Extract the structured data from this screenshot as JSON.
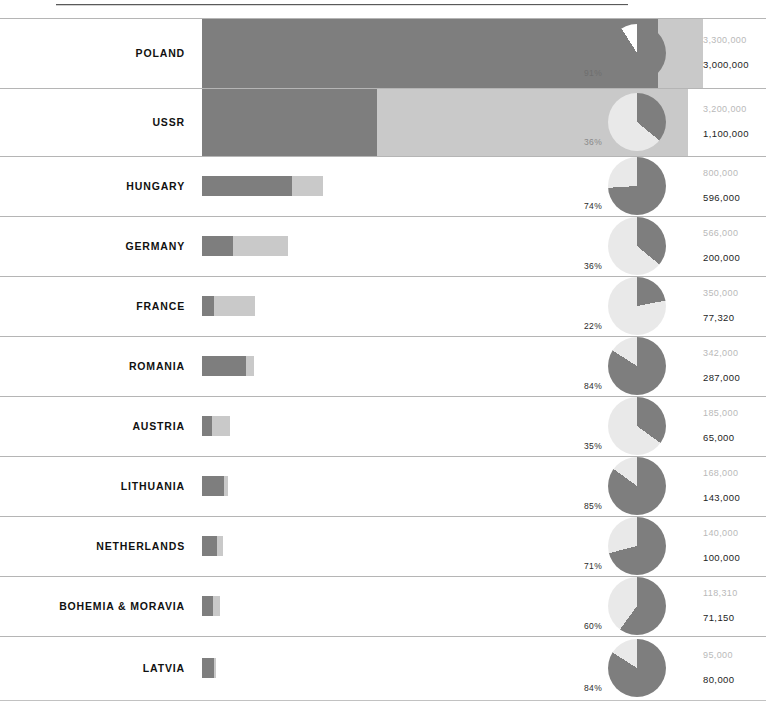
{
  "chart_data": {
    "type": "bar",
    "title": "",
    "subtitle": "",
    "xlabel": "",
    "ylabel": "",
    "legend": [],
    "grid": false,
    "orientation": "horizontal",
    "categories": [
      "POLAND",
      "USSR",
      "HUNGARY",
      "GERMANY",
      "FRANCE",
      "ROMANIA",
      "AUSTRIA",
      "LITHUANIA",
      "NETHERLANDS",
      "BOHEMIA & MORAVIA",
      "LATVIA"
    ],
    "series": [
      {
        "name": "total",
        "values": [
          3300000,
          3200000,
          800000,
          566000,
          350000,
          342000,
          185000,
          168000,
          140000,
          118310,
          95000
        ]
      },
      {
        "name": "killed",
        "values": [
          3000000,
          1100000,
          596000,
          200000,
          77320,
          287000,
          65000,
          143000,
          100000,
          71150,
          80000
        ]
      }
    ],
    "percent_values": [
      91,
      36,
      74,
      36,
      22,
      84,
      35,
      85,
      71,
      60,
      84
    ],
    "axis_max": 3300000
  },
  "rows": [
    {
      "label": "POLAND",
      "total_label": "3,300,000",
      "killed_label": "3,000,000",
      "pct_label": "91%",
      "pct_value": 91
    },
    {
      "label": "USSR",
      "total_label": "3,200,000",
      "killed_label": "1,100,000",
      "pct_label": "36%",
      "pct_value": 36
    },
    {
      "label": "HUNGARY",
      "total_label": "800,000",
      "killed_label": "596,000",
      "pct_label": "74%",
      "pct_value": 74
    },
    {
      "label": "GERMANY",
      "total_label": "566,000",
      "killed_label": "200,000",
      "pct_label": "36%",
      "pct_value": 36
    },
    {
      "label": "FRANCE",
      "total_label": "350,000",
      "killed_label": "77,320",
      "pct_label": "22%",
      "pct_value": 22
    },
    {
      "label": "ROMANIA",
      "total_label": "342,000",
      "killed_label": "287,000",
      "pct_label": "84%",
      "pct_value": 84
    },
    {
      "label": "AUSTRIA",
      "total_label": "185,000",
      "killed_label": "65,000",
      "pct_label": "35%",
      "pct_value": 35
    },
    {
      "label": "LITHUANIA",
      "total_label": "168,000",
      "killed_label": "143,000",
      "pct_label": "85%",
      "pct_value": 85
    },
    {
      "label": "NETHERLANDS",
      "total_label": "140,000",
      "killed_label": "100,000",
      "pct_label": "71%",
      "pct_value": 71
    },
    {
      "label": "BOHEMIA & MORAVIA",
      "total_label": "118,310",
      "killed_label": "71,150",
      "pct_label": "60%",
      "pct_value": 60
    },
    {
      "label": "LATVIA",
      "total_label": "95,000",
      "killed_label": "80,000",
      "pct_label": "84%",
      "pct_value": 84
    }
  ],
  "colors": {
    "dark": "#7e7e7e",
    "light": "#c9c9c9",
    "separator": "#b5b5b5",
    "value_muted": "#b9b9b9",
    "value_strong": "#1d1d1d",
    "label": "#111111"
  },
  "layout": {
    "bar_left_px": 202,
    "bar_max_right_px": 703,
    "pie_center_x_px": 637,
    "pie_diameter_px": 58,
    "row_tops": [
      18,
      88,
      156,
      216,
      276,
      336,
      396,
      456,
      516,
      576,
      636
    ],
    "row_heights": [
      70,
      68,
      60,
      60,
      60,
      60,
      60,
      60,
      60,
      60,
      64
    ],
    "band_rows": [
      0,
      1
    ],
    "bar_thickness_px": 20
  }
}
